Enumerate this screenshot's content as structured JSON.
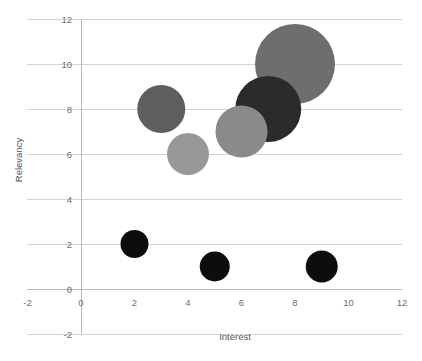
{
  "chart_data": {
    "type": "scatter",
    "subtype": "bubble",
    "title": "",
    "xlabel": "Interest",
    "ylabel": "Relevancy",
    "xlim": [
      -2,
      12
    ],
    "ylim": [
      -2,
      12
    ],
    "xticks": [
      "-2",
      "0",
      "2",
      "4",
      "6",
      "8",
      "10",
      "12"
    ],
    "yticks": [
      "-2",
      "0",
      "2",
      "4",
      "6",
      "8",
      "10",
      "12"
    ],
    "grid": "horizontal",
    "legend": "none",
    "points": [
      {
        "label": "",
        "x": 8,
        "y": 10,
        "size": 40,
        "color": "#6e6e6e"
      },
      {
        "label": "",
        "x": 7,
        "y": 8,
        "size": 33,
        "color": "#2b2b2b"
      },
      {
        "label": "",
        "x": 6,
        "y": 7,
        "size": 26,
        "color": "#8a8a8a"
      },
      {
        "label": "",
        "x": 3,
        "y": 8,
        "size": 24,
        "color": "#5e5e5e"
      },
      {
        "label": "",
        "x": 4,
        "y": 6,
        "size": 21,
        "color": "#989898"
      },
      {
        "label": "",
        "x": 2,
        "y": 2,
        "size": 14,
        "color": "#0d0d0d"
      },
      {
        "label": "",
        "x": 5,
        "y": 1,
        "size": 15,
        "color": "#0d0d0d"
      },
      {
        "label": "",
        "x": 9,
        "y": 1,
        "size": 16,
        "color": "#0d0d0d"
      }
    ],
    "colors": {
      "gridline": "#d4d4d4",
      "axis": "#b8b8b8",
      "ticklabel": "#6e6e6e",
      "axistitle": "#555555",
      "background": "#ffffff"
    }
  }
}
